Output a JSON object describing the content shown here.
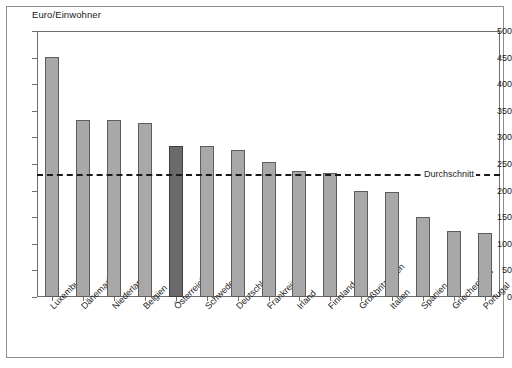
{
  "chart_data": {
    "type": "bar",
    "title": "",
    "ylabel": "Euro/Einwohner",
    "xlabel": "",
    "ylim": [
      0,
      500
    ],
    "ytick_step": 50,
    "yticks": [
      0,
      50,
      100,
      150,
      200,
      250,
      300,
      350,
      400,
      450,
      500
    ],
    "grid": false,
    "legend": "none",
    "categories": [
      "Luxemburg",
      "Dänemark",
      "Niederlande",
      "Belgien",
      "Österreich",
      "Schweden",
      "Deutschland",
      "Frankreich",
      "Irland",
      "Finnland",
      "Großbritannien",
      "Italien",
      "Spanien",
      "Griechenland",
      "Portugal"
    ],
    "values": [
      451,
      332,
      332,
      327,
      284,
      284,
      277,
      253,
      237,
      234,
      199,
      197,
      151,
      125,
      120
    ],
    "highlight_index": 4,
    "bar_color": "#a8a8a8",
    "highlight_color": "#6b6b6b",
    "bar_edge_color": "#5d5d5d",
    "annotations": [
      {
        "name": "average-line",
        "label": "Durchschnitt",
        "value": 231,
        "style": "dashed",
        "color": "#1a1a1a"
      }
    ]
  }
}
